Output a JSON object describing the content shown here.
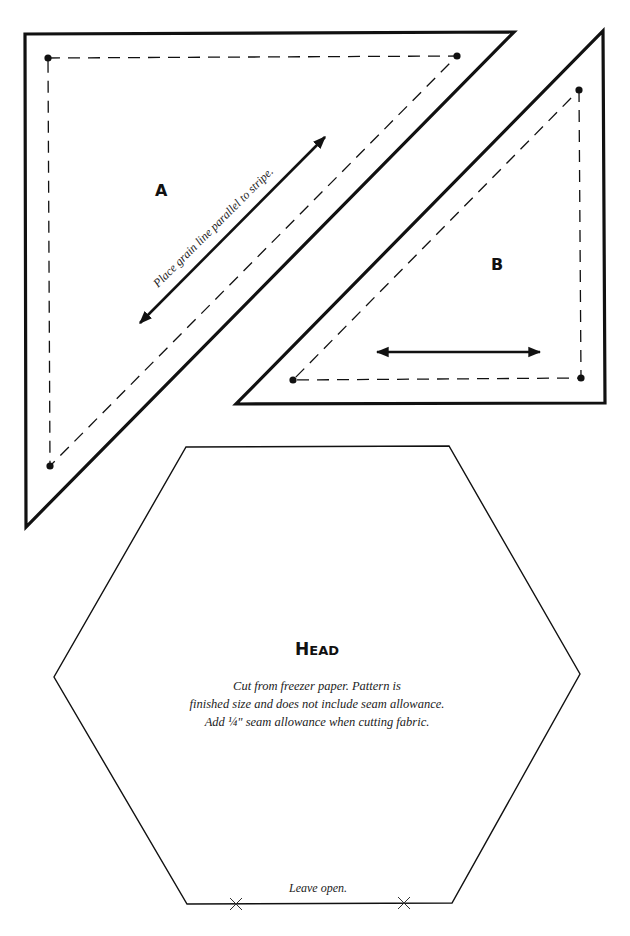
{
  "piece_a": {
    "label": "A",
    "grain_note": "Place grain line parallel to stripe."
  },
  "piece_b": {
    "label": "B"
  },
  "head": {
    "title_cap": "H",
    "title_rest": "EAD",
    "instructions": [
      "Cut from freezer paper. Pattern is",
      "finished size and does not include seam allowance.",
      "Add ¼\" seam allowance when cutting fabric."
    ],
    "opening_note": "Leave open."
  },
  "colors": {
    "line": "#111111",
    "background": "#ffffff"
  }
}
